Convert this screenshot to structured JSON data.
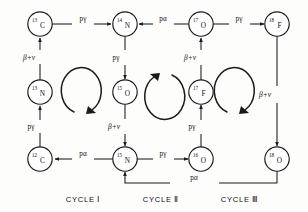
{
  "diagram": {
    "background_color": "#fdfdfc",
    "ink_color": "#1a1a1a"
  },
  "nodes": [
    {
      "id": "c13",
      "mass": "13",
      "symbol": "C",
      "x": 40,
      "y": 24
    },
    {
      "id": "n14",
      "mass": "14",
      "symbol": "N",
      "x": 125,
      "y": 24
    },
    {
      "id": "o17",
      "mass": "17",
      "symbol": "O",
      "x": 201,
      "y": 24
    },
    {
      "id": "f18",
      "mass": "18",
      "symbol": "F",
      "x": 277,
      "y": 24
    },
    {
      "id": "n13",
      "mass": "13",
      "symbol": "N",
      "x": 40,
      "y": 92
    },
    {
      "id": "o15",
      "mass": "15",
      "symbol": "O",
      "x": 125,
      "y": 92
    },
    {
      "id": "f17",
      "mass": "17",
      "symbol": "F",
      "x": 201,
      "y": 92
    },
    {
      "id": "c12",
      "mass": "12",
      "symbol": "C",
      "x": 40,
      "y": 159
    },
    {
      "id": "n15",
      "mass": "15",
      "symbol": "N",
      "x": 125,
      "y": 159
    },
    {
      "id": "o16",
      "mass": "16",
      "symbol": "O",
      "x": 201,
      "y": 159
    },
    {
      "id": "o18",
      "mass": "18",
      "symbol": "O",
      "x": 277,
      "y": 159
    }
  ],
  "edges": [
    {
      "id": "c13-to-n14",
      "label": "pγ",
      "from": "c13",
      "to": "n14",
      "lx": 83,
      "ly": 21
    },
    {
      "id": "o17-to-n14",
      "label": "pα",
      "from": "o17",
      "to": "n14",
      "lx": 163,
      "ly": 21
    },
    {
      "id": "o17-to-f18",
      "label": "pγ",
      "from": "o17",
      "to": "f18",
      "lx": 239,
      "ly": 21
    },
    {
      "id": "n13-to-c13",
      "label": "β+ν",
      "from": "n13",
      "to": "c13",
      "lx": 29,
      "ly": 58
    },
    {
      "id": "n14-to-o15",
      "label": "pγ",
      "from": "n14",
      "to": "o15",
      "lx": 116,
      "ly": 58
    },
    {
      "id": "f17-to-o17",
      "label": "β+ν",
      "from": "f17",
      "to": "o17",
      "lx": 190,
      "ly": 58
    },
    {
      "id": "f18-to-o18",
      "label": "β+ν",
      "from": "f18",
      "to": "o18",
      "lx": 266,
      "ly": 95
    },
    {
      "id": "c12-to-n13",
      "label": "pγ",
      "from": "c12",
      "to": "n13",
      "lx": 31,
      "ly": 127
    },
    {
      "id": "o15-to-n15",
      "label": "β+ν",
      "from": "o15",
      "to": "n15",
      "lx": 114,
      "ly": 127
    },
    {
      "id": "o16-to-f17",
      "label": "pγ",
      "from": "o16",
      "to": "f17",
      "lx": 192,
      "ly": 127
    },
    {
      "id": "n15-to-c12",
      "label": "pα",
      "from": "n15",
      "to": "c12",
      "lx": 83,
      "ly": 156
    },
    {
      "id": "n15-to-o16",
      "label": "pγ",
      "from": "n15",
      "to": "o16",
      "lx": 163,
      "ly": 156
    },
    {
      "id": "o18-to-n15",
      "label": "pα",
      "from": "o18",
      "to": "n15",
      "lx": 194,
      "ly": 180
    }
  ],
  "cycle_arrows": [
    {
      "id": "cycle-arrow-1",
      "cx": 85,
      "cy": 94,
      "direction": "clockwise"
    },
    {
      "id": "cycle-arrow-2",
      "cx": 163,
      "cy": 94,
      "direction": "counterclockwise"
    },
    {
      "id": "cycle-arrow-3",
      "cx": 238,
      "cy": 94,
      "direction": "clockwise"
    }
  ],
  "captions": [
    {
      "id": "caption-cycle-1",
      "text": "CYCLE Ⅰ",
      "x": 83,
      "y": 200
    },
    {
      "id": "caption-cycle-2",
      "text": "CYCLE Ⅱ",
      "x": 161,
      "y": 200
    },
    {
      "id": "caption-cycle-3",
      "text": "CYCLE Ⅲ",
      "x": 240,
      "y": 200
    }
  ]
}
